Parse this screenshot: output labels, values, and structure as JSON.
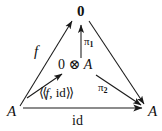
{
  "diagram": {
    "type": "commutative-diagram",
    "background_color": "#ffffff",
    "ink_color": "#1a1a1a",
    "nodes": [
      {
        "id": "top",
        "label": "0",
        "x": 81,
        "y": 12,
        "role": "terminal-object"
      },
      {
        "id": "center",
        "label": "0 ⊗ A",
        "x": 81,
        "y": 66,
        "role": "tensor-object"
      },
      {
        "id": "bottom-left",
        "label": "A",
        "x": 12,
        "y": 112,
        "role": "source-object"
      },
      {
        "id": "bottom-right",
        "label": "A",
        "x": 150,
        "y": 112,
        "role": "target-object"
      }
    ],
    "node_parts": {
      "center_zero": "0",
      "center_tensor": "⊗",
      "center_a": "A"
    },
    "edges": [
      {
        "id": "f",
        "label": "f",
        "from": "bottom-left",
        "to": "top",
        "label_x": 36,
        "label_y": 44
      },
      {
        "id": "pi1",
        "label": "π",
        "sub": "1",
        "from": "center",
        "to": "top",
        "label_x": 86,
        "label_y": 36
      },
      {
        "id": "pairing",
        "label": "⟪f, id⟫",
        "from": "bottom-left",
        "to": "center",
        "label_x": 40,
        "label_y": 88
      },
      {
        "id": "pi2",
        "label": "π",
        "sub": "2",
        "from": "center",
        "to": "bottom-right",
        "label_x": 100,
        "label_y": 83
      },
      {
        "id": "zero-to-a",
        "label": "",
        "from": "top",
        "to": "bottom-right",
        "label_x": 0,
        "label_y": 0
      },
      {
        "id": "id",
        "label": "id",
        "from": "bottom-left",
        "to": "bottom-right",
        "label_x": 72,
        "label_y": 116
      }
    ],
    "pairing_parts": {
      "open_bracket": "⟨⟨",
      "f": "f",
      "comma": ", ",
      "id": "id",
      "close_bracket": "⟩⟩"
    }
  }
}
